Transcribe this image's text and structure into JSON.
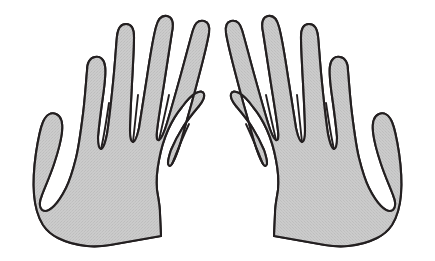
{
  "figure": {
    "background_color": "#ffffff",
    "canvas": {
      "width": 435,
      "height": 261
    }
  },
  "style": {
    "fill_color": "#c9c9c9",
    "texture_color": "#b8b8b8",
    "outline_color": "#231f20",
    "outline_width": 2.1
  },
  "hands": [
    {
      "id": "left-hand",
      "label": "Left hand",
      "side": "left",
      "orientation": "palm-forward",
      "bounding_box": {
        "x": 31,
        "y": 16,
        "width": 172,
        "height": 231
      },
      "digits": [
        {
          "name": "pinky",
          "tip": {
            "x": 47,
            "y": 89
          }
        },
        {
          "name": "ring",
          "tip": {
            "x": 66,
            "y": 44
          }
        },
        {
          "name": "middle",
          "tip": {
            "x": 89,
            "y": 21
          }
        },
        {
          "name": "index",
          "tip": {
            "x": 120,
            "y": 22
          }
        },
        {
          "name": "thumb",
          "tip": {
            "x": 189,
            "y": 92
          }
        }
      ],
      "cuff": {
        "bottom_left": {
          "x": 110,
          "y": 245
        },
        "bottom_right": {
          "x": 161,
          "y": 236
        }
      }
    },
    {
      "id": "right-hand",
      "label": "Right hand",
      "side": "right",
      "orientation": "palm-forward",
      "bounding_box": {
        "x": 232,
        "y": 16,
        "width": 172,
        "height": 231
      },
      "digits": [
        {
          "name": "thumb",
          "tip": {
            "x": 246,
            "y": 92
          }
        },
        {
          "name": "index",
          "tip": {
            "x": 315,
            "y": 22
          }
        },
        {
          "name": "middle",
          "tip": {
            "x": 346,
            "y": 21
          }
        },
        {
          "name": "ring",
          "tip": {
            "x": 369,
            "y": 44
          }
        },
        {
          "name": "pinky",
          "tip": {
            "x": 388,
            "y": 89
          }
        }
      ],
      "cuff": {
        "bottom_left": {
          "x": 274,
          "y": 236
        },
        "bottom_right": {
          "x": 325,
          "y": 245
        }
      }
    }
  ]
}
